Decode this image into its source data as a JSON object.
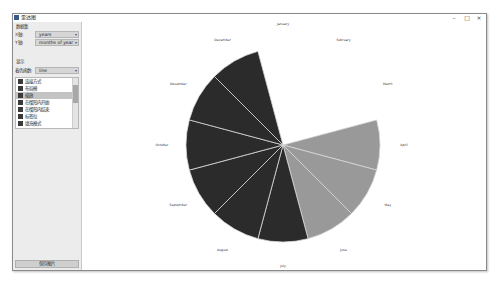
{
  "window": {
    "title": "雷达图",
    "controls": {
      "minimize": "–",
      "maximize": "□",
      "close": "×"
    }
  },
  "sidebar": {
    "data_section_title": "数据集",
    "row1_label": "X轴:",
    "row1_value": "years",
    "row2_label": "Y轴:",
    "row2_value": "months of year",
    "display_section_title": "显示",
    "row3_label": "着色函数:",
    "row3_value": "line",
    "list_items": [
      {
        "label": "连接方式"
      },
      {
        "label": "布局模"
      },
      {
        "label": "缩放"
      },
      {
        "label": "在楔形内开始"
      },
      {
        "label": "在楔形内结束"
      },
      {
        "label": "标签位"
      },
      {
        "label": "填充模式"
      }
    ],
    "selected_index": 2,
    "bottom_button": "保存图片"
  },
  "chart_data": {
    "type": "polar-area",
    "title": "",
    "categories": [
      "January",
      "February",
      "March",
      "April",
      "May",
      "June",
      "July",
      "August",
      "September",
      "October",
      "November",
      "December"
    ],
    "values": [
      0,
      0,
      0,
      1,
      1,
      1,
      1,
      1,
      1,
      1,
      1,
      1
    ],
    "colors": [
      "#999999",
      "#999999",
      "#999999",
      "#999999",
      "#999999",
      "#999999",
      "#2b2b2b",
      "#2b2b2b",
      "#2b2b2b",
      "#2b2b2b",
      "#2b2b2b",
      "#2b2b2b"
    ],
    "start_angle_deg": -15,
    "legend": false,
    "grid": false
  }
}
